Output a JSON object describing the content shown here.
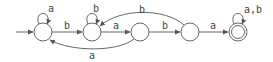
{
  "diagram": {
    "type": "finite-automaton",
    "states": [
      {
        "id": "q0",
        "initial": true,
        "accepting": false
      },
      {
        "id": "q1",
        "initial": false,
        "accepting": false
      },
      {
        "id": "q2",
        "initial": false,
        "accepting": false
      },
      {
        "id": "q3",
        "initial": false,
        "accepting": false
      },
      {
        "id": "q4",
        "initial": false,
        "accepting": true
      }
    ],
    "transitions": [
      {
        "from": "q0",
        "to": "q0",
        "label": "a"
      },
      {
        "from": "q0",
        "to": "q1",
        "label": "b"
      },
      {
        "from": "q1",
        "to": "q1",
        "label": "b"
      },
      {
        "from": "q1",
        "to": "q2",
        "label": "a"
      },
      {
        "from": "q2",
        "to": "q0",
        "label": "a"
      },
      {
        "from": "q2",
        "to": "q3",
        "label": "b"
      },
      {
        "from": "q3",
        "to": "q1",
        "label": "b"
      },
      {
        "from": "q3",
        "to": "q4",
        "label": "a"
      },
      {
        "from": "q4",
        "to": "q4",
        "label": "a,b"
      }
    ]
  },
  "labels": {
    "q0_self": "a",
    "q0_q1": "b",
    "q1_self": "b",
    "q1_q2": "a",
    "q2_q0": "a",
    "q2_q3": "b",
    "q3_q1": "b",
    "q3_q4": "a",
    "q4_self": "a,b"
  }
}
